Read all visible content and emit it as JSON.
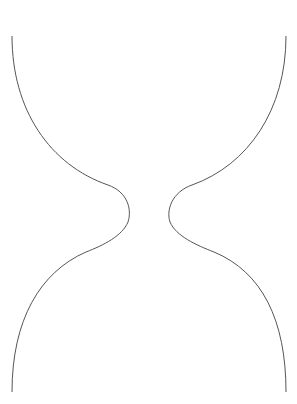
{
  "colors": {
    "ink": "#1a1a1a",
    "outline": "#555555",
    "background": "#ffffff"
  },
  "top_row": {
    "char": "人",
    "count": 10
  },
  "bottom_row": {
    "char": "人",
    "count": 10,
    "orientation": "upside-down"
  },
  "characters": {
    "fish": "魚",
    "sculpt": "塑"
  },
  "upper_bulb": [
    {
      "c": "魚",
      "x": 62,
      "y": 48,
      "r": -20,
      "s": 17
    },
    {
      "c": "塑",
      "x": 206,
      "y": 62,
      "r": -80,
      "s": 17
    },
    {
      "c": "塑",
      "x": 120,
      "y": 80,
      "r": -90,
      "s": 16
    },
    {
      "c": "魚",
      "x": 112,
      "y": 112,
      "r": -30,
      "s": 17
    },
    {
      "c": "塑",
      "x": 48,
      "y": 117,
      "r": -10,
      "s": 17
    },
    {
      "c": "塑",
      "x": 172,
      "y": 91,
      "r": -40,
      "s": 16
    },
    {
      "c": "魚",
      "x": 208,
      "y": 110,
      "r": -20,
      "s": 17
    },
    {
      "c": "塑",
      "x": 238,
      "y": 100,
      "r": -50,
      "s": 16
    },
    {
      "c": "塑",
      "x": 215,
      "y": 143,
      "r": -70,
      "s": 16
    },
    {
      "c": "塑",
      "x": 132,
      "y": 122,
      "r": -80,
      "s": 16
    },
    {
      "c": "塑",
      "x": 148,
      "y": 128,
      "r": -60,
      "s": 16
    },
    {
      "c": "塑",
      "x": 70,
      "y": 150,
      "r": -90,
      "s": 16
    },
    {
      "c": "塑",
      "x": 96,
      "y": 142,
      "r": -40,
      "s": 16
    },
    {
      "c": "塑",
      "x": 112,
      "y": 155,
      "r": -90,
      "s": 16
    },
    {
      "c": "塑",
      "x": 160,
      "y": 150,
      "r": -70,
      "s": 16
    },
    {
      "c": "塑",
      "x": 178,
      "y": 138,
      "r": -30,
      "s": 16
    },
    {
      "c": "塑",
      "x": 196,
      "y": 152,
      "r": -80,
      "s": 16
    },
    {
      "c": "塑",
      "x": 232,
      "y": 150,
      "r": -60,
      "s": 16
    },
    {
      "c": "魚",
      "x": 88,
      "y": 168,
      "r": -80,
      "s": 16
    },
    {
      "c": "塑",
      "x": 124,
      "y": 170,
      "r": -50,
      "s": 16
    },
    {
      "c": "魚",
      "x": 142,
      "y": 165,
      "r": -20,
      "s": 16
    },
    {
      "c": "塑",
      "x": 162,
      "y": 175,
      "r": -90,
      "s": 16
    },
    {
      "c": "塑",
      "x": 182,
      "y": 168,
      "r": -60,
      "s": 16
    },
    {
      "c": "塑",
      "x": 204,
      "y": 170,
      "r": -30,
      "s": 16
    },
    {
      "c": "塑",
      "x": 104,
      "y": 185,
      "r": -70,
      "s": 15
    },
    {
      "c": "塑",
      "x": 128,
      "y": 190,
      "r": -40,
      "s": 15
    },
    {
      "c": "魚",
      "x": 148,
      "y": 188,
      "r": -90,
      "s": 15
    },
    {
      "c": "塑",
      "x": 168,
      "y": 192,
      "r": -20,
      "s": 15
    },
    {
      "c": "塑",
      "x": 138,
      "y": 205,
      "r": -60,
      "s": 15
    },
    {
      "c": "塑",
      "x": 150,
      "y": 216,
      "r": -80,
      "s": 15
    }
  ],
  "lower_bulb": [
    {
      "c": "魚",
      "x": 142,
      "y": 230,
      "r": 150,
      "s": 15
    },
    {
      "c": "塑",
      "x": 160,
      "y": 236,
      "r": 110,
      "s": 15
    },
    {
      "c": "魚",
      "x": 124,
      "y": 244,
      "r": 160,
      "s": 16
    },
    {
      "c": "魚",
      "x": 176,
      "y": 246,
      "r": 130,
      "s": 16
    },
    {
      "c": "塑",
      "x": 104,
      "y": 254,
      "r": 100,
      "s": 16
    },
    {
      "c": "魚",
      "x": 196,
      "y": 256,
      "r": 170,
      "s": 16
    },
    {
      "c": "魚",
      "x": 84,
      "y": 262,
      "r": 140,
      "s": 16
    },
    {
      "c": "魚",
      "x": 140,
      "y": 260,
      "r": 120,
      "s": 16
    },
    {
      "c": "魚",
      "x": 160,
      "y": 266,
      "r": 180,
      "s": 16
    },
    {
      "c": "魚",
      "x": 214,
      "y": 264,
      "r": 150,
      "s": 16
    },
    {
      "c": "魚",
      "x": 64,
      "y": 272,
      "r": 170,
      "s": 16
    },
    {
      "c": "塑",
      "x": 118,
      "y": 272,
      "r": 90,
      "s": 16
    },
    {
      "c": "魚",
      "x": 180,
      "y": 278,
      "r": 130,
      "s": 16
    },
    {
      "c": "魚",
      "x": 236,
      "y": 278,
      "r": 160,
      "s": 16
    },
    {
      "c": "魚",
      "x": 96,
      "y": 282,
      "r": 120,
      "s": 16
    },
    {
      "c": "魚",
      "x": 140,
      "y": 286,
      "r": 160,
      "s": 16
    },
    {
      "c": "塑",
      "x": 200,
      "y": 290,
      "r": 100,
      "s": 16
    },
    {
      "c": "魚",
      "x": 76,
      "y": 294,
      "r": 150,
      "s": 16
    },
    {
      "c": "魚",
      "x": 118,
      "y": 298,
      "r": 180,
      "s": 16
    },
    {
      "c": "魚",
      "x": 162,
      "y": 300,
      "r": 140,
      "s": 16
    },
    {
      "c": "魚",
      "x": 236,
      "y": 300,
      "r": 170,
      "s": 16
    },
    {
      "c": "魚",
      "x": 100,
      "y": 312,
      "r": 130,
      "s": 16
    },
    {
      "c": "魚",
      "x": 194,
      "y": 316,
      "r": 160,
      "s": 16
    },
    {
      "c": "魚",
      "x": 60,
      "y": 306,
      "r": 150,
      "s": 16
    },
    {
      "c": "魚",
      "x": 118,
      "y": 333,
      "r": 160,
      "s": 16
    },
    {
      "c": "塑",
      "x": 180,
      "y": 352,
      "r": 90,
      "s": 16
    },
    {
      "c": "魚",
      "x": 240,
      "y": 355,
      "r": 170,
      "s": 16
    },
    {
      "c": "魚",
      "x": 96,
      "y": 374,
      "r": 180,
      "s": 16
    },
    {
      "c": "魚",
      "x": 46,
      "y": 304,
      "r": 160,
      "s": 16
    }
  ]
}
